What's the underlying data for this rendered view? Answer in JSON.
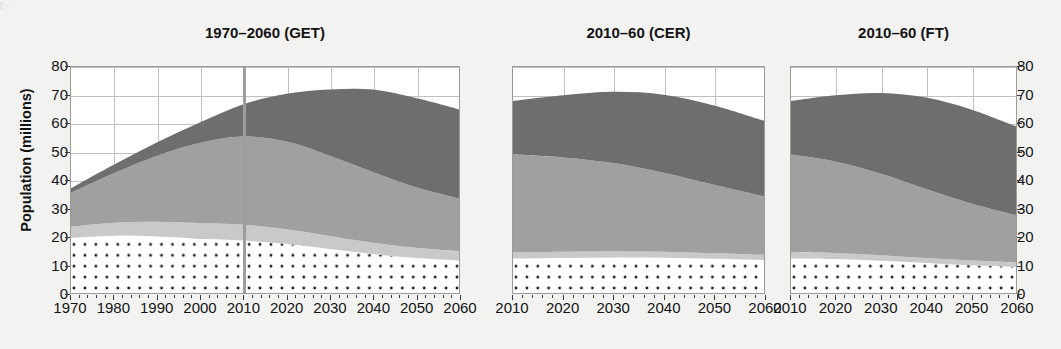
{
  "figure": {
    "caption_strip": "  t       ·              ·                                                                                                                        ",
    "ylabel": "Population (millions)",
    "yticks": [
      0,
      10,
      20,
      30,
      40,
      50,
      60,
      70,
      80
    ],
    "colors": {
      "background": "#f2f2f1",
      "plot_background": "#ffffff",
      "grid": "#bfbfc6",
      "axis": "#9a9a9a",
      "divider": "#9d9d9d",
      "series_1_dotted": "#ffffff",
      "series_1_dots": "#1c1c1c",
      "series_2_light": "#c9c9c9",
      "series_3_medium": "#a0a0a0",
      "series_4_dark": "#6e6e6e"
    }
  },
  "panels": [
    {
      "id": "get",
      "title": "1970–2060 (GET)",
      "xticks": [
        1970,
        1980,
        1990,
        2000,
        2010,
        2020,
        2030,
        2040,
        2050,
        2060
      ],
      "xlim": [
        1970,
        2060
      ],
      "divider_year": 2010
    },
    {
      "id": "cer",
      "title": "2010–60 (CER)",
      "xticks": [
        2010,
        2020,
        2030,
        2040,
        2050,
        2060
      ],
      "xlim": [
        2010,
        2060
      ],
      "divider_year": null
    },
    {
      "id": "ft",
      "title": "2010–60 (FT)",
      "xticks": [
        2010,
        2020,
        2030,
        2040,
        2050,
        2060
      ],
      "xlim": [
        2010,
        2060
      ],
      "divider_year": null
    }
  ],
  "chart_data": {
    "type": "area",
    "xlabel": "",
    "ylabel": "Population (millions)",
    "ylim": [
      0,
      80
    ],
    "grid": true,
    "legend_position": "none",
    "stacked": true,
    "series_names": [
      "band-1 (dotted)",
      "band-2 (light grey)",
      "band-3 (mid grey)",
      "band-4 (dark grey)"
    ],
    "panels": [
      {
        "id": "get",
        "title": "1970–2060 (GET)",
        "x": [
          1970,
          1980,
          1990,
          2000,
          2010,
          2020,
          2030,
          2040,
          2050,
          2060
        ],
        "series": [
          {
            "name": "band-1 (dotted)",
            "values": [
              19.5,
              20.3,
              20.0,
              19.2,
              18.6,
              17.4,
              15.6,
              13.8,
              12.4,
              11.5
            ]
          },
          {
            "name": "band-2 (light grey)",
            "values": [
              4.0,
              4.6,
              5.2,
              5.6,
              5.6,
              5.2,
              4.6,
              4.0,
              3.6,
              3.3
            ]
          },
          {
            "name": "band-3 (mid grey)",
            "values": [
              12.0,
              17.6,
              23.4,
              28.4,
              31.2,
              31.0,
              28.4,
              25.0,
              21.4,
              18.6
            ]
          },
          {
            "name": "band-4 (dark grey)",
            "values": [
              1.6,
              3.0,
              4.8,
              7.2,
              11.4,
              16.9,
              23.4,
              29.2,
              31.6,
              31.6
            ]
          }
        ],
        "totals": [
          37.1,
          45.5,
          53.4,
          60.4,
          66.8,
          70.5,
          72.0,
          72.0,
          69.0,
          65.0
        ]
      },
      {
        "id": "cer",
        "title": "2010–60 (CER)",
        "x": [
          2010,
          2020,
          2030,
          2040,
          2050,
          2060
        ],
        "series": [
          {
            "name": "band-1 (dotted)",
            "values": [
              12.2,
              12.4,
              12.6,
              12.5,
              12.1,
              11.6
            ]
          },
          {
            "name": "band-2 (light grey)",
            "values": [
              2.2,
              2.2,
              2.2,
              2.1,
              2.0,
              1.9
            ]
          },
          {
            "name": "band-3 (mid grey)",
            "values": [
              34.6,
              33.4,
              31.2,
              28.0,
              24.2,
              20.7
            ]
          },
          {
            "name": "band-4 (dark grey)",
            "values": [
              19.0,
              22.0,
              25.2,
              27.6,
              28.1,
              26.8
            ]
          }
        ],
        "totals": [
          68.0,
          70.0,
          71.2,
          70.2,
          66.4,
          61.0
        ]
      },
      {
        "id": "ft",
        "title": "2010–60 (FT)",
        "x": [
          2010,
          2020,
          2030,
          2040,
          2050,
          2060
        ],
        "series": [
          {
            "name": "band-1 (dotted)",
            "values": [
              12.2,
              12.0,
              11.4,
              10.6,
              9.8,
              9.2
            ]
          },
          {
            "name": "band-2 (light grey)",
            "values": [
              2.2,
              2.1,
              2.0,
              1.8,
              1.7,
              1.6
            ]
          },
          {
            "name": "band-3 (mid grey)",
            "values": [
              34.6,
              32.4,
              28.8,
              24.4,
              20.2,
              16.8
            ]
          },
          {
            "name": "band-4 (dark grey)",
            "values": [
              19.0,
              23.5,
              28.6,
              32.4,
              33.3,
              31.4
            ]
          }
        ],
        "totals": [
          68.0,
          70.0,
          70.8,
          69.2,
          65.0,
          59.0
        ]
      }
    ]
  }
}
